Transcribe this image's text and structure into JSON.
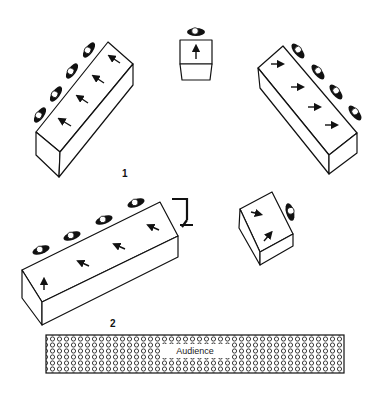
{
  "diagram": {
    "type": "stage-layout",
    "labels": {
      "platform_group_1": "1",
      "platform_group_2": "2",
      "audience": "Audience"
    },
    "elements": [
      {
        "id": "platform-top-left",
        "performers": 4,
        "arrows": 4
      },
      {
        "id": "platform-top-center",
        "performers": 1,
        "arrows": 1
      },
      {
        "id": "platform-top-right",
        "performers": 4,
        "arrows": 4
      },
      {
        "id": "platform-bottom-left",
        "performers": 4,
        "arrows": 4,
        "has_stand": true
      },
      {
        "id": "platform-bottom-right",
        "performers": 1,
        "arrows": 2
      },
      {
        "id": "audience-area",
        "pattern": "circles"
      }
    ],
    "colors": {
      "line": "#111111",
      "fill": "#ffffff"
    }
  }
}
